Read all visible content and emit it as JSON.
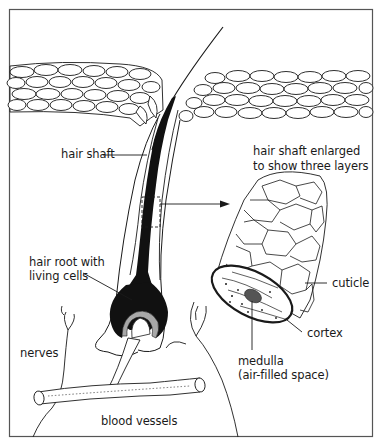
{
  "diagram": {
    "labels": {
      "hair_shaft": "hair shaft",
      "enlarged_line1": "hair shaft enlarged",
      "enlarged_line2": "to show three layers",
      "hair_root_line1": "hair root with",
      "hair_root_line2": "living cells",
      "cuticle": "cuticle",
      "cortex": "cortex",
      "medulla_line1": "medulla",
      "medulla_line2": "(air-filled space)",
      "nerves": "nerves",
      "blood_vessels": "blood vessels"
    },
    "colors": {
      "stroke": "#1a1a1a",
      "fill_dark": "#111111",
      "root_ring": "#a8a8a8",
      "frame": "#555555",
      "background": "#ffffff"
    }
  }
}
